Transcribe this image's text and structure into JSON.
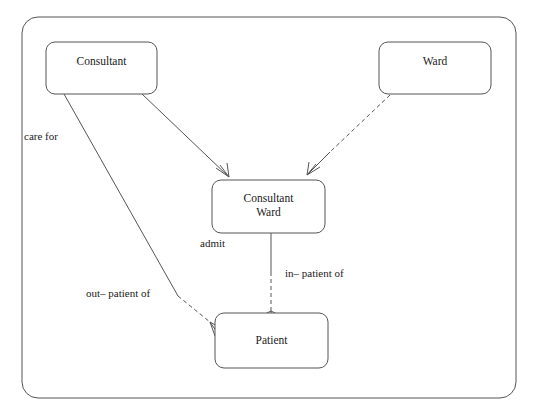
{
  "diagram": {
    "type": "entity-relationship-diagram",
    "frame": {
      "name": "diagram-frame",
      "x": 22,
      "y": 17,
      "width": 494,
      "height": 381,
      "radius": 16
    },
    "entities": [
      {
        "id": "consultant",
        "label": "Consultant",
        "lines": [
          "Consultant"
        ],
        "x": 46,
        "y": 42,
        "width": 111,
        "height": 52,
        "radius": 9
      },
      {
        "id": "ward",
        "label": "Ward",
        "lines": [
          "Ward"
        ],
        "x": 379,
        "y": 42,
        "width": 112,
        "height": 52,
        "radius": 9
      },
      {
        "id": "consultant-ward",
        "label": "Consultant Ward",
        "lines": [
          "Consultant",
          "Ward"
        ],
        "x": 212,
        "y": 180,
        "width": 113,
        "height": 53,
        "radius": 9
      },
      {
        "id": "patient",
        "label": "Patient",
        "lines": [
          "Patient"
        ],
        "x": 215,
        "y": 313,
        "width": 113,
        "height": 55,
        "radius": 9
      }
    ],
    "relationships": [
      {
        "id": "care-for",
        "label": "care for",
        "from": "consultant",
        "to": "patient",
        "label_x": 24,
        "label_y": 137,
        "style": "solid-to-dashed",
        "crow_foot_at": "patient"
      },
      {
        "id": "consultant-to-consultant-ward",
        "label": "",
        "from": "consultant",
        "to": "consultant-ward",
        "style": "solid",
        "crow_foot_at": "consultant-ward"
      },
      {
        "id": "ward-to-consultant-ward",
        "label": "",
        "from": "ward",
        "to": "consultant-ward",
        "style": "dashed-to-solid",
        "crow_foot_at": "consultant-ward"
      },
      {
        "id": "admit",
        "label": "admit",
        "from": "consultant-ward",
        "to": "patient",
        "label_x": 200,
        "label_y": 244,
        "style": "solid-to-dashed",
        "crow_foot_at": "patient"
      },
      {
        "id": "in-patient-of",
        "label": "in– patient of",
        "label_x": 285,
        "label_y": 274,
        "style": "label-only"
      },
      {
        "id": "out-patient-of",
        "label": "out– patient of",
        "label_x": 86,
        "label_y": 294,
        "style": "label-only"
      }
    ]
  },
  "colors": {
    "stroke": "#555555",
    "text": "#1a1a1a",
    "background": "#ffffff"
  }
}
